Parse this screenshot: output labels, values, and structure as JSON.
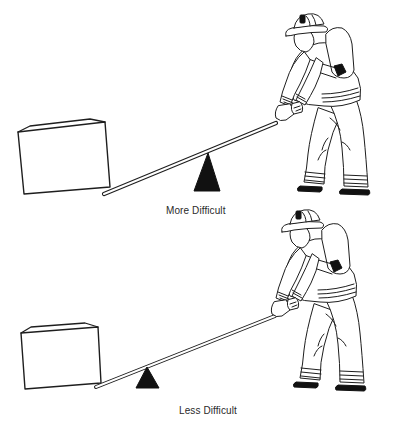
{
  "figure": {
    "panels": [
      {
        "id": "top",
        "caption": "More Difficult",
        "elements": [
          "box",
          "lever-bar",
          "fulcrum",
          "firefighter"
        ],
        "fulcrum_position": "near firefighter (far from load)"
      },
      {
        "id": "bottom",
        "caption": "Less Difficult",
        "elements": [
          "box",
          "lever-bar",
          "fulcrum",
          "firefighter"
        ],
        "fulcrum_position": "near load (far from firefighter)"
      }
    ]
  },
  "colors": {
    "ink": "#1e1e1e",
    "fulcrum": "#111111",
    "background": "#ffffff",
    "caption_text": "#2a2a2a"
  }
}
